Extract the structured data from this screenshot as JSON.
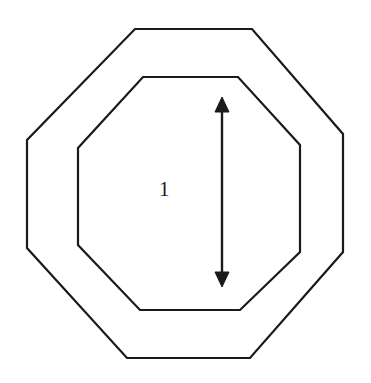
{
  "figure": {
    "background_color": "#ffffff",
    "stroke_color": "#1a1a1a",
    "text_color": "#1a1a1a",
    "canvas": {
      "width": 371,
      "height": 383
    }
  },
  "labels": {
    "dimension_value": "1"
  },
  "annotations": {
    "dimension_label_x": 159,
    "dimension_label_y": 179
  },
  "chart_data": {
    "type": "diagram",
    "shapes": [
      {
        "name": "outer-octagon",
        "kind": "polygon",
        "stroke": "#1a1a1a",
        "stroke_width": 2.2,
        "fill": "none",
        "points": [
          [
            135,
            29
          ],
          [
            252,
            29
          ],
          [
            343,
            134
          ],
          [
            343,
            252
          ],
          [
            250,
            358
          ],
          [
            127,
            358
          ],
          [
            27,
            248
          ],
          [
            27,
            140
          ]
        ]
      },
      {
        "name": "inner-octagon",
        "kind": "polygon",
        "stroke": "#1a1a1a",
        "stroke_width": 2.2,
        "fill": "none",
        "points": [
          [
            143,
            77
          ],
          [
            238,
            77
          ],
          [
            300,
            145
          ],
          [
            300,
            252
          ],
          [
            240,
            310
          ],
          [
            140,
            310
          ],
          [
            78,
            245
          ],
          [
            78,
            148
          ]
        ]
      }
    ],
    "arrows": [
      {
        "name": "vertical-dimension-arrow",
        "kind": "double-headed-arrow",
        "orientation": "vertical",
        "stroke": "#1a1a1a",
        "stroke_width": 2.4,
        "x": 222,
        "y_top": 97,
        "y_bottom": 287,
        "head_width": 14,
        "head_length": 15,
        "label": "1"
      }
    ],
    "text_annotations": [
      {
        "text": "1",
        "x": 166,
        "y": 191,
        "anchor": "middle",
        "font_size": 21
      }
    ],
    "xlabel": "",
    "ylabel": "",
    "grid": false,
    "legend": false
  }
}
